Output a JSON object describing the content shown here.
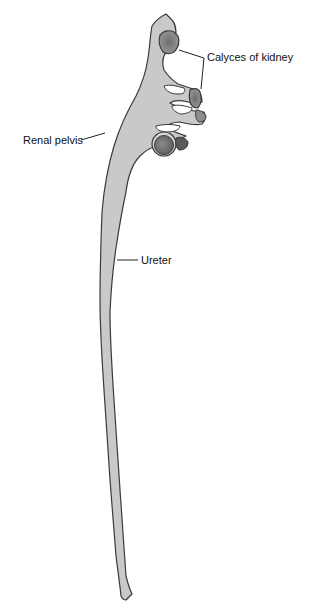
{
  "figure": {
    "labels": {
      "calyces": "Calyces of kidney",
      "pelvis": "Renal pelvis",
      "ureter": "Ureter"
    },
    "colors": {
      "background": "#ffffff",
      "tissue_fill": "#c9c9c9",
      "outline": "#3a3a3a",
      "calyx_dark": "#7a7a7a",
      "leader_line": "#222222"
    }
  }
}
